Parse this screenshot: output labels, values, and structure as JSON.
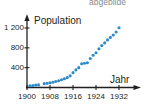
{
  "page": {
    "cut_off_text": "abgebilde"
  },
  "chart_data": {
    "type": "scatter",
    "title": "",
    "subtitle": "",
    "xlabel": "Jahr",
    "ylabel": "Population",
    "grid": false,
    "legend": null,
    "marker_color": "#2e8bc9",
    "axis_color": "#231f20",
    "xlim": [
      1899,
      1934
    ],
    "ylim": [
      0,
      1280
    ],
    "xticks": [
      1900,
      1908,
      1916,
      1924,
      1932
    ],
    "xtick_labels": [
      "1900",
      "1908",
      "1916",
      "1924",
      "1932"
    ],
    "yticks": [
      400,
      800,
      1200
    ],
    "ytick_labels": [
      "400",
      "800",
      "1 200"
    ],
    "series": [
      {
        "name": "Population",
        "x": [
          1901,
          1902,
          1903,
          1904,
          1906,
          1907,
          1908,
          1909,
          1910,
          1911,
          1912,
          1913,
          1914,
          1915,
          1916,
          1917,
          1918,
          1919,
          1920,
          1921,
          1922,
          1923,
          1924,
          1925,
          1926,
          1927,
          1928,
          1929,
          1930,
          1931,
          1932
        ],
        "y": [
          35,
          40,
          48,
          52,
          78,
          85,
          95,
          105,
          120,
          135,
          155,
          175,
          200,
          235,
          300,
          355,
          400,
          480,
          490,
          500,
          585,
          650,
          700,
          780,
          845,
          900,
          960,
          1010,
          1060,
          1120,
          1205
        ]
      }
    ]
  }
}
